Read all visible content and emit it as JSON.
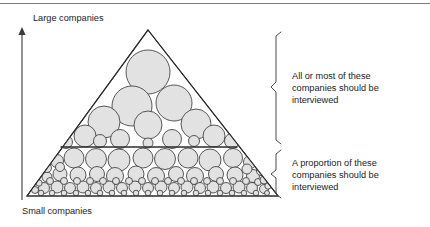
{
  "figure": {
    "title_rule": true,
    "axis": {
      "top_label": "Large companies",
      "bottom_label": "Small companies",
      "arrow_direction": "up"
    },
    "annotations": [
      {
        "id": "upper",
        "lines": [
          "All or most of these",
          "companies should be",
          "interviewed"
        ]
      },
      {
        "id": "lower",
        "lines": [
          "A proportion of these",
          "companies should be",
          "interviewed"
        ]
      }
    ],
    "colors": {
      "circle_fill": "#e2e2e2",
      "circle_stroke": "#3c3c3c",
      "line": "#2b2b2b",
      "text": "#1b1b1b",
      "bracket": "#4a4a4a"
    },
    "triangle": {
      "apex": [
        148,
        30
      ],
      "left": [
        27,
        196
      ],
      "right": [
        278,
        196
      ],
      "divider_y": 147
    },
    "circles": [
      {
        "cx": 148,
        "cy": 72,
        "r": 22
      },
      {
        "cx": 132,
        "cy": 106,
        "r": 20
      },
      {
        "cx": 174,
        "cy": 103,
        "r": 18
      },
      {
        "cx": 104,
        "cy": 122,
        "r": 16
      },
      {
        "cx": 196,
        "cy": 124,
        "r": 15
      },
      {
        "cx": 148,
        "cy": 125,
        "r": 14
      },
      {
        "cx": 85,
        "cy": 136,
        "r": 11
      },
      {
        "cx": 214,
        "cy": 136,
        "r": 11
      },
      {
        "cx": 120,
        "cy": 139,
        "r": 9.5
      },
      {
        "cx": 172,
        "cy": 139,
        "r": 9.5
      },
      {
        "cx": 66,
        "cy": 142,
        "r": 6.5
      },
      {
        "cx": 232,
        "cy": 141,
        "r": 7.5
      },
      {
        "cx": 100,
        "cy": 141,
        "r": 6.5
      },
      {
        "cx": 194,
        "cy": 141,
        "r": 5.5
      },
      {
        "cx": 148,
        "cy": 143,
        "r": 5.0
      },
      {
        "cx": 74,
        "cy": 158,
        "r": 10
      },
      {
        "cx": 96,
        "cy": 159,
        "r": 10.5
      },
      {
        "cx": 119,
        "cy": 160,
        "r": 11
      },
      {
        "cx": 143,
        "cy": 158,
        "r": 10
      },
      {
        "cx": 165,
        "cy": 159,
        "r": 10.5
      },
      {
        "cx": 188,
        "cy": 158,
        "r": 10
      },
      {
        "cx": 210,
        "cy": 160,
        "r": 11
      },
      {
        "cx": 233,
        "cy": 158,
        "r": 9.5
      },
      {
        "cx": 57,
        "cy": 161,
        "r": 6.5
      },
      {
        "cx": 250,
        "cy": 162,
        "r": 6.5
      },
      {
        "cx": 60,
        "cy": 174,
        "r": 7
      },
      {
        "cx": 78,
        "cy": 175,
        "r": 8
      },
      {
        "cx": 97,
        "cy": 174,
        "r": 7.5
      },
      {
        "cx": 115,
        "cy": 176,
        "r": 8.5
      },
      {
        "cx": 136,
        "cy": 174,
        "r": 8
      },
      {
        "cx": 156,
        "cy": 176,
        "r": 8.5
      },
      {
        "cx": 176,
        "cy": 174,
        "r": 7.5
      },
      {
        "cx": 195,
        "cy": 176,
        "r": 8.5
      },
      {
        "cx": 216,
        "cy": 174,
        "r": 7.5
      },
      {
        "cx": 235,
        "cy": 175,
        "r": 8
      },
      {
        "cx": 253,
        "cy": 176,
        "r": 6.5
      },
      {
        "cx": 47,
        "cy": 177,
        "r": 5
      },
      {
        "cx": 44,
        "cy": 188,
        "r": 5.5
      },
      {
        "cx": 57,
        "cy": 187,
        "r": 6
      },
      {
        "cx": 70,
        "cy": 188,
        "r": 5.5
      },
      {
        "cx": 83,
        "cy": 187,
        "r": 6
      },
      {
        "cx": 96,
        "cy": 188,
        "r": 5.5
      },
      {
        "cx": 109,
        "cy": 187,
        "r": 6
      },
      {
        "cx": 122,
        "cy": 188,
        "r": 5.5
      },
      {
        "cx": 135,
        "cy": 187,
        "r": 6
      },
      {
        "cx": 148,
        "cy": 188,
        "r": 5.5
      },
      {
        "cx": 161,
        "cy": 187,
        "r": 6
      },
      {
        "cx": 174,
        "cy": 188,
        "r": 5.5
      },
      {
        "cx": 187,
        "cy": 187,
        "r": 6
      },
      {
        "cx": 200,
        "cy": 188,
        "r": 5.5
      },
      {
        "cx": 213,
        "cy": 187,
        "r": 6
      },
      {
        "cx": 226,
        "cy": 188,
        "r": 5.5
      },
      {
        "cx": 239,
        "cy": 187,
        "r": 6
      },
      {
        "cx": 252,
        "cy": 188,
        "r": 5.5
      },
      {
        "cx": 264,
        "cy": 189,
        "r": 4.5
      },
      {
        "cx": 35,
        "cy": 190,
        "r": 3.5
      },
      {
        "cx": 50,
        "cy": 181,
        "r": 3.5
      },
      {
        "cx": 64,
        "cy": 181,
        "r": 3.5
      },
      {
        "cx": 77,
        "cy": 181,
        "r": 3.5
      },
      {
        "cx": 90,
        "cy": 181,
        "r": 3.5
      },
      {
        "cx": 103,
        "cy": 181,
        "r": 3.5
      },
      {
        "cx": 116,
        "cy": 181,
        "r": 3.5
      },
      {
        "cx": 129,
        "cy": 181,
        "r": 3.5
      },
      {
        "cx": 142,
        "cy": 181,
        "r": 3.5
      },
      {
        "cx": 155,
        "cy": 181,
        "r": 3.5
      },
      {
        "cx": 168,
        "cy": 181,
        "r": 3.5
      },
      {
        "cx": 181,
        "cy": 181,
        "r": 3.5
      },
      {
        "cx": 194,
        "cy": 181,
        "r": 3.5
      },
      {
        "cx": 207,
        "cy": 181,
        "r": 3.5
      },
      {
        "cx": 220,
        "cy": 181,
        "r": 3.5
      },
      {
        "cx": 233,
        "cy": 181,
        "r": 3.5
      },
      {
        "cx": 246,
        "cy": 181,
        "r": 3.5
      },
      {
        "cx": 258,
        "cy": 182,
        "r": 3.5
      },
      {
        "cx": 41,
        "cy": 193,
        "r": 2.8
      },
      {
        "cx": 52,
        "cy": 193,
        "r": 2.8
      },
      {
        "cx": 64,
        "cy": 193,
        "r": 2.8
      },
      {
        "cx": 76,
        "cy": 193,
        "r": 2.8
      },
      {
        "cx": 88,
        "cy": 193,
        "r": 2.8
      },
      {
        "cx": 100,
        "cy": 193,
        "r": 2.8
      },
      {
        "cx": 112,
        "cy": 193,
        "r": 2.8
      },
      {
        "cx": 124,
        "cy": 193,
        "r": 2.8
      },
      {
        "cx": 136,
        "cy": 193,
        "r": 2.8
      },
      {
        "cx": 148,
        "cy": 193,
        "r": 2.8
      },
      {
        "cx": 160,
        "cy": 193,
        "r": 2.8
      },
      {
        "cx": 172,
        "cy": 193,
        "r": 2.8
      },
      {
        "cx": 184,
        "cy": 193,
        "r": 2.8
      },
      {
        "cx": 196,
        "cy": 193,
        "r": 2.8
      },
      {
        "cx": 208,
        "cy": 193,
        "r": 2.8
      },
      {
        "cx": 220,
        "cy": 193,
        "r": 2.8
      },
      {
        "cx": 232,
        "cy": 193,
        "r": 2.8
      },
      {
        "cx": 244,
        "cy": 193,
        "r": 2.8
      },
      {
        "cx": 256,
        "cy": 193,
        "r": 2.8
      },
      {
        "cx": 267,
        "cy": 193,
        "r": 2.5
      },
      {
        "cx": 47,
        "cy": 168,
        "r": 4.5
      },
      {
        "cx": 60,
        "cy": 167,
        "r": 4.5
      },
      {
        "cx": 247,
        "cy": 169,
        "r": 5.0
      },
      {
        "cx": 261,
        "cy": 171,
        "r": 4.5
      },
      {
        "cx": 264,
        "cy": 180,
        "r": 4.0
      },
      {
        "cx": 39,
        "cy": 183,
        "r": 3.2
      },
      {
        "cx": 268,
        "cy": 186,
        "r": 3.2
      }
    ]
  }
}
